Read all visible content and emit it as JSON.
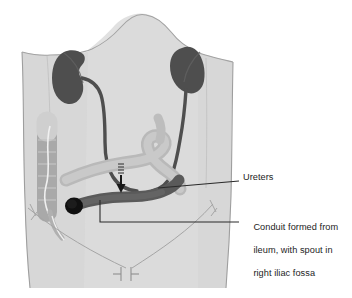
{
  "figure": {
    "view": "anterior abdominal wall, schematic"
  },
  "labels": {
    "ureters": {
      "text": "Ureters",
      "leader_from": "conduit-ureter-anastomosis",
      "leader_to": "right-margin"
    },
    "conduit": {
      "line1": "Conduit formed from",
      "line2": "ileum, with spout in",
      "line3": "right iliac fossa",
      "leader_from": "ileal-conduit",
      "leader_to": "right-margin"
    }
  },
  "anatomy": {
    "torso": "abdominal silhouette",
    "kidney_left": "left kidney",
    "kidney_right": "right kidney",
    "ureter_left": "left ureter",
    "ureter_right": "right ureter",
    "bowel_loop": "small bowel / ileum loop",
    "colon": "descending colon with haustra",
    "conduit": "ileal conduit",
    "spout": "stoma spout in right iliac fossa",
    "arrow": "direction of urine flow",
    "inguinal_ligaments": "inguinal ligaments",
    "pubic_symphysis": "pubic symphysis marker"
  },
  "colors": {
    "background": "#ffffff",
    "torso_fill": "#d6d6d6",
    "torso_fill_light": "#dedede",
    "torso_outline": "#9a9a9a",
    "kidney": "#4e4e4e",
    "ureter": "#4e4e4e",
    "conduit": "#5a5a5a",
    "bowel_loop": "#b4b4b4",
    "colon": "#a8a8a8",
    "spout": "#101010",
    "leader_line": "#2a2a2a",
    "text": "#1d1d1d"
  }
}
